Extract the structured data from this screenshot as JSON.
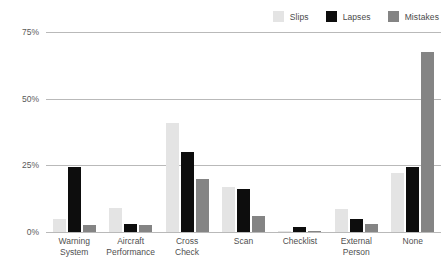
{
  "chart_data": {
    "type": "bar",
    "title": "",
    "subtitle": "",
    "xlabel": "",
    "ylabel": "",
    "ylim": [
      0,
      75
    ],
    "yticks": [
      0,
      25,
      50,
      75
    ],
    "ytick_labels": [
      "0%",
      "25%",
      "50%",
      "75%"
    ],
    "grid": true,
    "legend_position": "top-right",
    "categories": [
      "Warning System",
      "Aircraft Performance",
      "Cross Check",
      "Scan",
      "Checklist",
      "External Person",
      "None"
    ],
    "category_lines": [
      [
        "Warning",
        "System"
      ],
      [
        "Aircraft",
        "Performance"
      ],
      [
        "Cross",
        "Check"
      ],
      [
        "Scan"
      ],
      [
        "Checklist"
      ],
      [
        "External",
        "Person"
      ],
      [
        "None"
      ]
    ],
    "series": [
      {
        "name": "Slips",
        "color": "#e4e4e4",
        "values": [
          5,
          9,
          41,
          17,
          0.5,
          8.5,
          22
        ]
      },
      {
        "name": "Lapses",
        "color": "#0d0d0d",
        "values": [
          24.5,
          3,
          30,
          16,
          2,
          5,
          24.5
        ]
      },
      {
        "name": "Mistakes",
        "color": "#848484",
        "values": [
          2.5,
          2.5,
          20,
          6,
          0.4,
          3,
          67.5
        ]
      }
    ]
  },
  "legend": {
    "items": [
      {
        "label": "Slips",
        "color": "#e4e4e4"
      },
      {
        "label": "Lapses",
        "color": "#0d0d0d"
      },
      {
        "label": "Mistakes",
        "color": "#848484"
      }
    ]
  },
  "colors": {
    "gridline": "#b9b9b9",
    "text": "#4f4f4f",
    "background": "#ffffff"
  }
}
